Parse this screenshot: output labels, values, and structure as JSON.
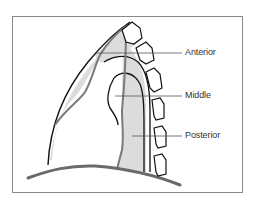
{
  "diagram": {
    "labels": {
      "anterior": "Anterior",
      "middle": "Middle",
      "posterior": "Posterior"
    },
    "colors": {
      "frame": "#8a8a8a",
      "outline": "#111111",
      "shade": "#dcdcdc",
      "gray_line": "#7a7a7a",
      "leader": "#555555",
      "text": "#333333"
    }
  }
}
